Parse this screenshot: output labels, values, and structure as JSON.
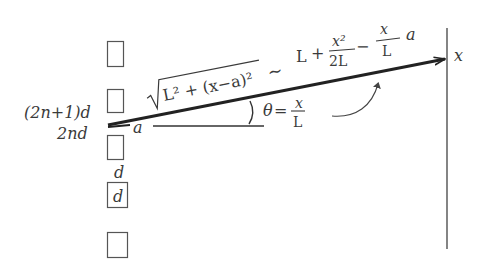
{
  "diagram": {
    "slit_labels": {
      "odd": "(2n+1)d",
      "even": "2nd",
      "spacing_top": "d",
      "spacing_box": "d"
    },
    "offset_label": "a",
    "path_formula": {
      "sqrt_body": "L² + (x−a)²",
      "approx": "∼",
      "L": "L",
      "plus": "+",
      "frac1_num": "x²",
      "frac1_den": "2L",
      "minus": "−",
      "frac2_num": "x",
      "frac2_den": "L",
      "trailing": "a"
    },
    "angle_formula": {
      "theta": "θ",
      "eq": "=",
      "num": "x",
      "den": "L"
    },
    "screen_label": "x",
    "colors": {
      "ink": "#3a3a3a",
      "ray": "#222222",
      "box": "#555555",
      "screen": "#666666"
    }
  }
}
